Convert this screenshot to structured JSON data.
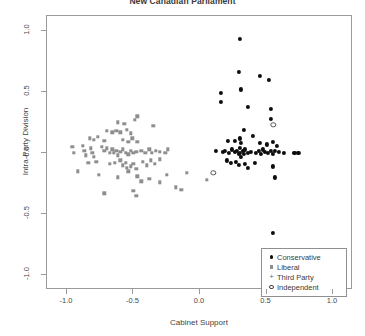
{
  "chart_data": {
    "type": "scatter",
    "title": "New Canadian Parliament",
    "xlabel": "Cabinet Support",
    "ylabel": "Intra-Party Division",
    "xlim": [
      -1.15,
      1.15
    ],
    "ylim": [
      -1.12,
      1.12
    ],
    "xticks": [
      -1.0,
      -0.5,
      0.0,
      0.5,
      1.0
    ],
    "xtick_labels": [
      "-1.0",
      "-0.5",
      "0.0",
      "0.5",
      "1.0"
    ],
    "yticks": [
      1.0,
      0.5,
      0.0,
      -0.5,
      -1.0
    ],
    "ytick_labels": [
      "1.0",
      "0.5",
      "0.0",
      "-0.5",
      "-1.0"
    ],
    "grid": false,
    "legend_position": "bottom-right",
    "legend": [
      {
        "label": "Conservative",
        "marker": "filled-circle",
        "color": "#0d0d0d"
      },
      {
        "label": "Liberal",
        "marker": "small-square",
        "color": "#8e8e8e"
      },
      {
        "label": "Third Party",
        "marker": "plus",
        "color": "#7a7a7a"
      },
      {
        "label": "Independent",
        "marker": "open-circle",
        "color": "#444444"
      }
    ],
    "series": [
      {
        "name": "Conservative",
        "marker": "filled-circle",
        "color": "#0d0d0d",
        "points": [
          [
            0.3,
            0.93
          ],
          [
            0.29,
            0.66
          ],
          [
            0.45,
            0.63
          ],
          [
            0.52,
            0.6
          ],
          [
            0.31,
            0.52
          ],
          [
            0.16,
            0.49
          ],
          [
            0.16,
            0.42
          ],
          [
            0.36,
            0.38
          ],
          [
            0.53,
            0.36
          ],
          [
            0.53,
            0.28
          ],
          [
            0.33,
            0.19
          ],
          [
            0.4,
            0.14
          ],
          [
            0.21,
            0.1
          ],
          [
            0.26,
            0.1
          ],
          [
            0.3,
            0.12
          ],
          [
            0.31,
            0.08
          ],
          [
            0.45,
            0.08
          ],
          [
            0.5,
            0.07
          ],
          [
            0.55,
            0.09
          ],
          [
            0.58,
            0.06
          ],
          [
            0.12,
            0.02
          ],
          [
            0.17,
            0.01
          ],
          [
            0.19,
            0.02
          ],
          [
            0.22,
            0.0
          ],
          [
            0.24,
            0.03
          ],
          [
            0.26,
            0.01
          ],
          [
            0.28,
            0.02
          ],
          [
            0.29,
            -0.01
          ],
          [
            0.3,
            0.04
          ],
          [
            0.3,
            0.0
          ],
          [
            0.31,
            -0.03
          ],
          [
            0.32,
            0.02
          ],
          [
            0.33,
            -0.01
          ],
          [
            0.34,
            0.03
          ],
          [
            0.36,
            0.0
          ],
          [
            0.38,
            0.01
          ],
          [
            0.42,
            0.0
          ],
          [
            0.44,
            0.02
          ],
          [
            0.46,
            -0.01
          ],
          [
            0.47,
            0.03
          ],
          [
            0.49,
            0.01
          ],
          [
            0.51,
            0.0
          ],
          [
            0.53,
            0.02
          ],
          [
            0.55,
            -0.01
          ],
          [
            0.56,
            0.02
          ],
          [
            0.59,
            0.01
          ],
          [
            0.63,
            0.0
          ],
          [
            0.71,
            0.0
          ],
          [
            0.74,
            0.0
          ],
          [
            0.2,
            -0.06
          ],
          [
            0.23,
            -0.08
          ],
          [
            0.27,
            -0.07
          ],
          [
            0.29,
            -0.1
          ],
          [
            0.34,
            -0.09
          ],
          [
            0.36,
            -0.12
          ],
          [
            0.41,
            -0.08
          ],
          [
            0.55,
            -0.11
          ],
          [
            0.56,
            -0.2
          ],
          [
            0.55,
            -0.65
          ]
        ]
      },
      {
        "name": "Liberal",
        "marker": "small-square",
        "color": "#8e8e8e",
        "points": [
          [
            -0.62,
            0.25
          ],
          [
            -0.57,
            0.24
          ],
          [
            -0.49,
            0.27
          ],
          [
            -0.47,
            0.3
          ],
          [
            -0.7,
            0.18
          ],
          [
            -0.66,
            0.17
          ],
          [
            -0.63,
            0.18
          ],
          [
            -0.6,
            0.17
          ],
          [
            -0.55,
            0.19
          ],
          [
            -0.52,
            0.16
          ],
          [
            -0.35,
            0.22
          ],
          [
            -0.83,
            0.12
          ],
          [
            -0.8,
            0.11
          ],
          [
            -0.77,
            0.13
          ],
          [
            -0.72,
            0.1
          ],
          [
            -0.58,
            0.11
          ],
          [
            -0.54,
            0.09
          ],
          [
            -0.51,
            0.12
          ],
          [
            -0.47,
            0.09
          ],
          [
            -0.96,
            0.05
          ],
          [
            -0.95,
            0.0
          ],
          [
            -0.88,
            0.06
          ],
          [
            -0.87,
            0.02
          ],
          [
            -0.86,
            -0.02
          ],
          [
            -0.82,
            0.04
          ],
          [
            -0.81,
            0.0
          ],
          [
            -0.8,
            -0.03
          ],
          [
            -0.74,
            0.05
          ],
          [
            -0.72,
            0.02
          ],
          [
            -0.7,
            0.04
          ],
          [
            -0.68,
            0.0
          ],
          [
            -0.66,
            0.03
          ],
          [
            -0.65,
            0.0
          ],
          [
            -0.63,
            0.02
          ],
          [
            -0.62,
            -0.02
          ],
          [
            -0.6,
            0.01
          ],
          [
            -0.58,
            0.03
          ],
          [
            -0.56,
            0.0
          ],
          [
            -0.54,
            -0.01
          ],
          [
            -0.52,
            0.02
          ],
          [
            -0.5,
            0.0
          ],
          [
            -0.48,
            0.01
          ],
          [
            -0.44,
            0.02
          ],
          [
            -0.41,
            0.0
          ],
          [
            -0.38,
            0.03
          ],
          [
            -0.36,
            0.0
          ],
          [
            -0.33,
            0.02
          ],
          [
            -0.3,
            0.01
          ],
          [
            -0.26,
            0.0
          ],
          [
            -0.24,
            0.03
          ],
          [
            -0.84,
            -0.08
          ],
          [
            -0.78,
            -0.07
          ],
          [
            -0.68,
            -0.09
          ],
          [
            -0.64,
            -0.08
          ],
          [
            -0.6,
            -0.06
          ],
          [
            -0.58,
            -0.1
          ],
          [
            -0.56,
            -0.08
          ],
          [
            -0.55,
            -0.12
          ],
          [
            -0.54,
            -0.15
          ],
          [
            -0.52,
            -0.11
          ],
          [
            -0.5,
            -0.09
          ],
          [
            -0.48,
            -0.13
          ],
          [
            -0.43,
            -0.07
          ],
          [
            -0.4,
            -0.1
          ],
          [
            -0.37,
            -0.06
          ],
          [
            -0.34,
            -0.09
          ],
          [
            -0.3,
            -0.05
          ],
          [
            -0.76,
            -0.18
          ],
          [
            -0.62,
            -0.2
          ],
          [
            -0.47,
            -0.19
          ],
          [
            -0.44,
            -0.23
          ],
          [
            -0.38,
            -0.21
          ],
          [
            -0.3,
            -0.24
          ],
          [
            -0.25,
            -0.18
          ],
          [
            -0.5,
            -0.31
          ],
          [
            -0.48,
            -0.35
          ],
          [
            -0.18,
            -0.28
          ],
          [
            -0.14,
            -0.3
          ],
          [
            -0.72,
            -0.33
          ],
          [
            -0.92,
            -0.15
          ],
          [
            -0.1,
            -0.16
          ],
          [
            0.05,
            -0.22
          ]
        ]
      },
      {
        "name": "Third Party",
        "marker": "plus",
        "color": "#7a7a7a",
        "points": []
      },
      {
        "name": "Independent",
        "marker": "open-circle",
        "color": "#444444",
        "points": [
          [
            0.55,
            0.23
          ],
          [
            0.1,
            -0.16
          ]
        ]
      }
    ]
  }
}
